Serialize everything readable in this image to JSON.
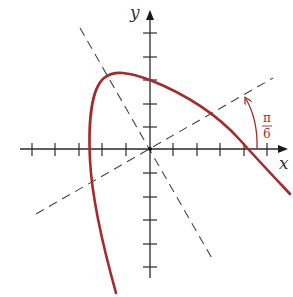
{
  "figure": {
    "axes": {
      "x_label": "x",
      "y_label": "y",
      "x_ticks": [
        -5,
        -4,
        -3,
        -2,
        -1,
        1,
        2,
        3,
        4,
        5
      ],
      "y_ticks": [
        -5,
        -4,
        -3,
        -2,
        -1,
        1,
        2,
        3,
        4,
        5
      ]
    },
    "rotated_axes": {
      "style": "dashed",
      "angle_label_numerator": "π",
      "angle_label_denominator": "6",
      "angle_radians": "π/6"
    },
    "curve": {
      "color": "#a52a2a",
      "description": "one branch of a conic, rising steeply from lower-left, peaking near (-1, 3.1), crossing y-axis near y = 3, and descending to the right crossing x-axis near x = 4"
    },
    "colors": {
      "axes": "#2a2a2a",
      "dashed": "#444444",
      "accent": "#a52a2a"
    }
  }
}
